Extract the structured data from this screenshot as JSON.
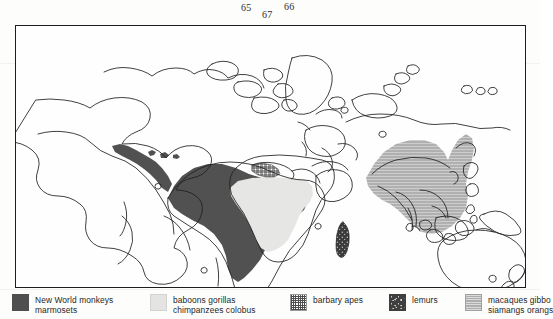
{
  "folio": {
    "numbers": [
      "65",
      "67",
      "66"
    ]
  },
  "figure": {
    "type": "world-distribution-map",
    "title": "",
    "frame": {
      "visible": true
    }
  },
  "legend": {
    "items": [
      {
        "swatch": "solid-dark-gray",
        "color": "#4f4f4f",
        "line1": "New World monkeys",
        "line2": "marmosets"
      },
      {
        "swatch": "light-gray",
        "color": "#e4e4e2",
        "line1": "baboons gorillas",
        "line2": "chimpanzees colobus"
      },
      {
        "swatch": "crosshatch",
        "color": "#4d4d4d",
        "line1": "barbary apes",
        "line2": ""
      },
      {
        "swatch": "dark-speckled",
        "color": "#3f3f3f",
        "line1": "lemurs",
        "line2": ""
      },
      {
        "swatch": "medium-gray-hatch",
        "color": "#aeaeae",
        "line1": "macaques gibbo",
        "line2": "siamangs orangs"
      }
    ]
  },
  "map": {
    "regions": [
      {
        "name": "central-and-south-america",
        "fill": "solid-dark-gray",
        "legend": "New World monkeys marmosets"
      },
      {
        "name": "sub-saharan-africa",
        "fill": "light-gray",
        "legend": "baboons gorillas chimpanzees colobus"
      },
      {
        "name": "northwest-africa",
        "fill": "crosshatch",
        "legend": "barbary apes"
      },
      {
        "name": "madagascar",
        "fill": "dark-speckled",
        "legend": "lemurs"
      },
      {
        "name": "south-and-southeast-asia",
        "fill": "medium-gray-hatch",
        "legend": "macaques gibbons siamangs orangutans"
      },
      {
        "name": "north-america",
        "fill": "none",
        "legend": ""
      },
      {
        "name": "europe-and-northern-asia",
        "fill": "none",
        "legend": ""
      },
      {
        "name": "australia",
        "fill": "none",
        "legend": ""
      },
      {
        "name": "new-zealand",
        "fill": "none",
        "legend": ""
      }
    ]
  }
}
